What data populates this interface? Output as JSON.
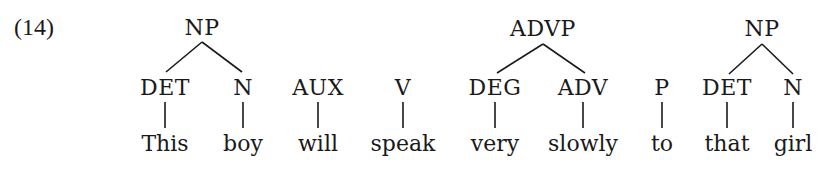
{
  "example_number": "(14)",
  "tree": {
    "phrases": [
      {
        "label": "NP",
        "x": 202,
        "children": [
          0,
          1
        ]
      },
      {
        "label": "ADVP",
        "x": 543,
        "children": [
          4,
          5
        ]
      },
      {
        "label": "NP",
        "x": 762,
        "children": [
          7,
          8
        ]
      }
    ],
    "terminals": [
      {
        "category": "DET",
        "word": "This",
        "x": 165
      },
      {
        "category": "N",
        "word": "boy",
        "x": 243
      },
      {
        "category": "AUX",
        "word": "will",
        "x": 318
      },
      {
        "category": "V",
        "word": "speak",
        "x": 403
      },
      {
        "category": "DEG",
        "word": "very",
        "x": 495
      },
      {
        "category": "ADV",
        "word": "slowly",
        "x": 583
      },
      {
        "category": "P",
        "word": "to",
        "x": 662
      },
      {
        "category": "DET",
        "word": "that",
        "x": 727
      },
      {
        "category": "N",
        "word": "girl",
        "x": 793
      }
    ]
  }
}
